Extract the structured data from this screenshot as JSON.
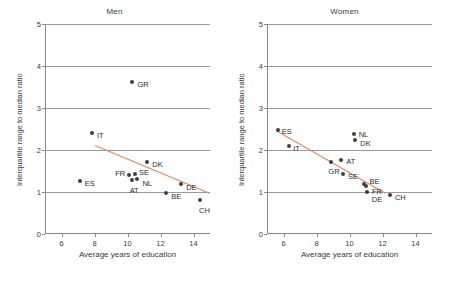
{
  "chart_data": [
    {
      "type": "scatter",
      "title": "Men",
      "xlabel": "Average years of education",
      "ylabel": "Interquartile range to median ratio",
      "xlim": [
        5,
        15
      ],
      "ylim": [
        0,
        5
      ],
      "xticks": [
        6,
        8,
        10,
        12,
        14
      ],
      "yticks": [
        0,
        1,
        2,
        3,
        4,
        5
      ],
      "grid": "horizontal",
      "legend": "none",
      "points": [
        {
          "label": "ES",
          "x": 7.1,
          "y": 1.27,
          "lx": 5,
          "ly": 3
        },
        {
          "label": "IT",
          "x": 7.85,
          "y": 2.4,
          "lx": 5,
          "ly": 3
        },
        {
          "label": "GR",
          "x": 10.3,
          "y": 3.63,
          "lx": 5,
          "ly": 3
        },
        {
          "label": "FR",
          "x": 10.1,
          "y": 1.4,
          "lx": -14,
          "ly": -1
        },
        {
          "label": "SE",
          "x": 10.45,
          "y": 1.43,
          "lx": 4,
          "ly": -1
        },
        {
          "label": "NL",
          "x": 10.6,
          "y": 1.3,
          "lx": 5,
          "ly": 5
        },
        {
          "label": "AT",
          "x": 10.25,
          "y": 1.28,
          "lx": -2,
          "ly": 11
        },
        {
          "label": "DK",
          "x": 11.2,
          "y": 1.72,
          "lx": 5,
          "ly": 3
        },
        {
          "label": "BE",
          "x": 12.35,
          "y": 0.97,
          "lx": 5,
          "ly": 4
        },
        {
          "label": "DE",
          "x": 13.25,
          "y": 1.18,
          "lx": 5,
          "ly": 4
        },
        {
          "label": "CH",
          "x": 14.4,
          "y": 0.8,
          "lx": -1,
          "ly": 11
        }
      ],
      "trendline": {
        "x0": 8.05,
        "y0": 2.12,
        "x1": 15.0,
        "y1": 0.98,
        "color": "#e8835a"
      }
    },
    {
      "type": "scatter",
      "title": "Women",
      "xlabel": "Average years of education",
      "ylabel": "Interquartile range to median ratio",
      "xlim": [
        5,
        15
      ],
      "ylim": [
        0,
        5
      ],
      "xticks": [
        6,
        8,
        10,
        12,
        14
      ],
      "yticks": [
        0,
        1,
        2,
        3,
        4,
        5
      ],
      "grid": "horizontal",
      "legend": "none",
      "points": [
        {
          "label": "ES",
          "x": 5.65,
          "y": 2.48,
          "lx": 4,
          "ly": 2
        },
        {
          "label": "IT",
          "x": 6.35,
          "y": 2.1,
          "lx": 4,
          "ly": 3
        },
        {
          "label": "GR",
          "x": 8.9,
          "y": 1.72,
          "lx": -3,
          "ly": 10
        },
        {
          "label": "AT",
          "x": 9.5,
          "y": 1.76,
          "lx": 5,
          "ly": 2
        },
        {
          "label": "SE",
          "x": 9.6,
          "y": 1.42,
          "lx": 5,
          "ly": 3
        },
        {
          "label": "NL",
          "x": 10.25,
          "y": 2.37,
          "lx": 5,
          "ly": 1
        },
        {
          "label": "DK",
          "x": 10.35,
          "y": 2.23,
          "lx": 5,
          "ly": 4
        },
        {
          "label": "BE",
          "x": 10.85,
          "y": 1.2,
          "lx": 6,
          "ly": -2
        },
        {
          "label": "FR",
          "x": 11.0,
          "y": 1.15,
          "lx": 6,
          "ly": 6
        },
        {
          "label": "DE",
          "x": 11.05,
          "y": 1.0,
          "lx": 5,
          "ly": 8
        },
        {
          "label": "CH",
          "x": 12.45,
          "y": 0.93,
          "lx": 5,
          "ly": 3
        }
      ],
      "trendline": {
        "x0": 5.55,
        "y0": 2.48,
        "x1": 12.15,
        "y1": 0.99,
        "color": "#e8835a"
      }
    }
  ]
}
